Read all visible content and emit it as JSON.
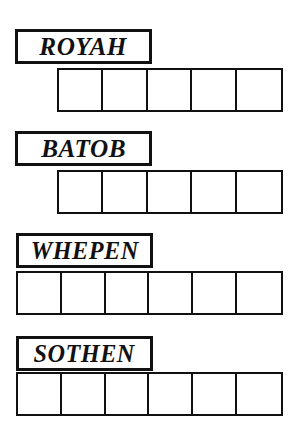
{
  "sheet": {
    "title": "Word Scramble Answer Grid Worksheet",
    "ink_color": "#111111",
    "paper_color": "#ffffff"
  },
  "rows": [
    {
      "clue_word": "ROYAH",
      "clue_box": {
        "left": 15,
        "top": 29,
        "width": 137,
        "height": 35,
        "font_size": 26
      },
      "grid": {
        "left": 57,
        "top": 68,
        "width": 226,
        "height": 44,
        "cell_count": 5
      },
      "circled_positions": [
        3,
        4
      ],
      "cells": [
        "",
        "",
        "",
        "",
        ""
      ]
    },
    {
      "clue_word": "BATOB",
      "clue_box": {
        "left": 15,
        "top": 131,
        "width": 137,
        "height": 35,
        "font_size": 26
      },
      "grid": {
        "left": 57,
        "top": 170,
        "width": 226,
        "height": 44,
        "cell_count": 5
      },
      "circled_positions": [
        3
      ],
      "cells": [
        "",
        "",
        "",
        "",
        ""
      ]
    },
    {
      "clue_word": "WHEPEN",
      "clue_box": {
        "left": 16,
        "top": 233,
        "width": 137,
        "height": 35,
        "font_size": 25
      },
      "grid": {
        "left": 16,
        "top": 271,
        "width": 267,
        "height": 44,
        "cell_count": 6
      },
      "circled_positions": [
        4
      ],
      "cells": [
        "",
        "",
        "",
        "",
        "",
        ""
      ]
    },
    {
      "clue_word": "SOTHEN",
      "clue_box": {
        "left": 16,
        "top": 336,
        "width": 137,
        "height": 35,
        "font_size": 25
      },
      "grid": {
        "left": 16,
        "top": 372,
        "width": 267,
        "height": 44,
        "cell_count": 6
      },
      "circled_positions": [
        4,
        6
      ],
      "cells": [
        "",
        "",
        "",
        "",
        "",
        ""
      ]
    }
  ]
}
